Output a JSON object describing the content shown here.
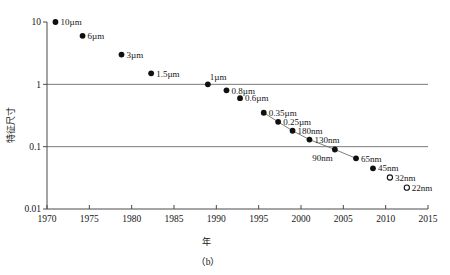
{
  "figure": {
    "caption": "（b）",
    "xlabel": "年",
    "ylabel": "特征尺寸"
  },
  "chart_data": {
    "type": "scatter",
    "title": "",
    "xlabel": "年",
    "ylabel": "特征尺寸",
    "xlim": [
      1970,
      2015
    ],
    "ylim": [
      0.01,
      10
    ],
    "yscale": "log",
    "grid": "horizontal-at-1-and-0.1",
    "legend": "none",
    "xticks": [
      "1970",
      "1975",
      "1980",
      "1985",
      "1990",
      "1995",
      "2000",
      "2005",
      "2010",
      "2015"
    ],
    "yticks": [
      "0.01",
      "0.1",
      "1",
      "10"
    ],
    "points": [
      {
        "label": "10µm",
        "x": 1971.0,
        "y": 10.0,
        "marker": "filled",
        "label_side": "right"
      },
      {
        "label": "6µm",
        "x": 1974.2,
        "y": 6.0,
        "marker": "filled",
        "label_side": "right"
      },
      {
        "label": "3µm",
        "x": 1978.8,
        "y": 3.0,
        "marker": "filled",
        "label_side": "right"
      },
      {
        "label": "1.5µm",
        "x": 1982.3,
        "y": 1.5,
        "marker": "filled",
        "label_side": "right"
      },
      {
        "label": "1µm",
        "x": 1989.0,
        "y": 1.0,
        "marker": "filled",
        "label_side": "above-right"
      },
      {
        "label": "0.8µm",
        "x": 1991.2,
        "y": 0.8,
        "marker": "filled",
        "label_side": "right"
      },
      {
        "label": "0.6µm",
        "x": 1992.8,
        "y": 0.6,
        "marker": "filled",
        "label_side": "right"
      },
      {
        "label": "0.35µm",
        "x": 1995.6,
        "y": 0.35,
        "marker": "filled",
        "label_side": "right"
      },
      {
        "label": "0.25µm",
        "x": 1997.3,
        "y": 0.25,
        "marker": "filled",
        "label_side": "right"
      },
      {
        "label": "180nm",
        "x": 1999.0,
        "y": 0.18,
        "marker": "filled",
        "label_side": "right"
      },
      {
        "label": "130nm",
        "x": 2001.0,
        "y": 0.13,
        "marker": "filled",
        "label_side": "right"
      },
      {
        "label": "90nm",
        "x": 2004.0,
        "y": 0.09,
        "marker": "filled",
        "label_side": "below-left"
      },
      {
        "label": "65nm",
        "x": 2006.5,
        "y": 0.065,
        "marker": "filled",
        "label_side": "right"
      },
      {
        "label": "45nm",
        "x": 2008.5,
        "y": 0.045,
        "marker": "filled",
        "label_side": "right"
      },
      {
        "label": "32nm",
        "x": 2010.5,
        "y": 0.032,
        "marker": "open",
        "label_side": "right"
      },
      {
        "label": "22nm",
        "x": 2012.5,
        "y": 0.022,
        "marker": "open",
        "label_side": "right"
      }
    ],
    "connectors": [
      {
        "from": "0.35µm",
        "to": "0.25µm"
      },
      {
        "from": "0.25µm",
        "to": "180nm"
      },
      {
        "from": "180nm",
        "to": "130nm"
      },
      {
        "from": "130nm",
        "to": "90nm"
      },
      {
        "from": "90nm",
        "to": "65nm"
      }
    ],
    "gridlines_y": [
      1.0,
      0.1
    ]
  }
}
